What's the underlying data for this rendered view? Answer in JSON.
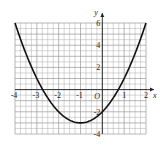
{
  "chart_data": {
    "type": "line",
    "title": "",
    "xlabel": "x",
    "ylabel": "y",
    "origin_label": "O",
    "xlim": [
      -4,
      2
    ],
    "ylim": [
      -4,
      6
    ],
    "grid": true,
    "x_ticks": [
      -4,
      -3,
      -2,
      -1,
      1,
      2
    ],
    "x_tick_labels": [
      "-4",
      "-3",
      "-2",
      "-1",
      "1",
      "2"
    ],
    "y_ticks": [
      -4,
      -2,
      2,
      4,
      6
    ],
    "y_tick_labels": [
      "-4",
      "-2",
      "2",
      "4",
      "6"
    ],
    "series": [
      {
        "name": "y = (x+1)^2 - 3",
        "x": [
          -4,
          -3.5,
          -3,
          -2.5,
          -2,
          -1.5,
          -1,
          -0.5,
          0,
          0.5,
          1,
          1.5,
          2
        ],
        "y": [
          6,
          3.25,
          1,
          -0.75,
          -2,
          -2.75,
          -3,
          -2.75,
          -2,
          -0.75,
          1,
          3.25,
          6
        ]
      }
    ],
    "vertex": [
      -1,
      -3
    ],
    "x_intercepts": [
      -2.73,
      0.73
    ],
    "y_intercept": -2
  },
  "colors": {
    "grid": "#9a9a9a",
    "axis": "#222222",
    "curve": "#111111"
  }
}
